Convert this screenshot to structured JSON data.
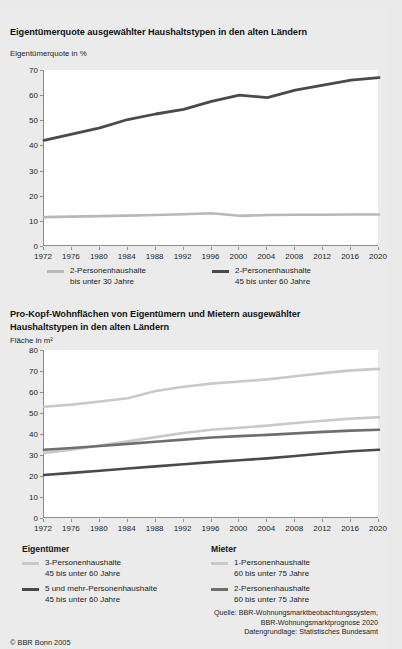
{
  "meta": {
    "copyright": "© BBR Bonn 2005",
    "source_lines": [
      "Quelle: BBR-Wohnungsmarktbeobachtungssystem,",
      "BBR-Wohnungsmarktprognose 2020",
      "Datengrundlage: Statistisches Bundesamt"
    ]
  },
  "colors": {
    "light": "#b8b8b8",
    "midlight": "#c9c9c9",
    "mid": "#6e6e6e",
    "dark": "#4a4a4a",
    "axis": "#8d8d8d",
    "background": "#ebebeb",
    "plot_background": "#ffffff"
  },
  "chart_data": [
    {
      "id": "eigentumerquote",
      "type": "line",
      "title": "Eigentümerquote ausgewählter Haushaltstypen in den alten Ländern",
      "ylabel": "Eigentümerquote in %",
      "xlabel": "",
      "ylim": [
        0,
        70
      ],
      "yticks": [
        0,
        10,
        20,
        30,
        40,
        50,
        60,
        70
      ],
      "x": [
        1972,
        1976,
        1980,
        1984,
        1988,
        1992,
        1996,
        2000,
        2004,
        2008,
        2012,
        2016,
        2020
      ],
      "xticks": [
        1972,
        1976,
        1980,
        1984,
        1988,
        1992,
        1996,
        2000,
        2004,
        2008,
        2012,
        2016,
        2020
      ],
      "grid": false,
      "legend_position": "bottom",
      "series": [
        {
          "name": "2-Personenhaushalte bis unter 30 Jahre",
          "label_line1": "2-Personenhaushalte",
          "label_line2": "bis unter 30 Jahre",
          "color": "#b8b8b8",
          "width": 2.6,
          "values": [
            11.5,
            11.7,
            11.9,
            12.1,
            12.3,
            12.6,
            13.0,
            12.0,
            12.3,
            12.4,
            12.4,
            12.5,
            12.5
          ]
        },
        {
          "name": "2-Personenhaushalte 45 bis unter 60 Jahre",
          "label_line1": "2-Personenhaushalte",
          "label_line2": "45 bis unter 60 Jahre",
          "color": "#4a4a4a",
          "width": 2.8,
          "values": [
            42.0,
            44.5,
            47.0,
            50.3,
            52.5,
            54.3,
            57.5,
            60.0,
            59.0,
            62.0,
            64.0,
            66.0,
            67.0
          ]
        }
      ]
    },
    {
      "id": "pro-kopf-wohnflaechen",
      "type": "line",
      "title": "Pro-Kopf-Wohnflächen von Eigentümern und Mietern ausgewählter Haushaltstypen in den alten Ländern",
      "title_line1": "Pro-Kopf-Wohnflächen von Eigentümern und Mietern ausgewählter",
      "title_line2": "Haushaltstypen in den alten Ländern",
      "ylabel": "Fläche in m²",
      "xlabel": "",
      "ylim": [
        0,
        80
      ],
      "yticks": [
        0,
        10,
        20,
        30,
        40,
        50,
        60,
        70,
        80
      ],
      "x": [
        1972,
        1976,
        1980,
        1984,
        1988,
        1992,
        1996,
        2000,
        2004,
        2008,
        2012,
        2016,
        2020
      ],
      "xticks": [
        1972,
        1976,
        1980,
        1984,
        1988,
        1992,
        1996,
        2000,
        2004,
        2008,
        2012,
        2016,
        2020
      ],
      "grid": false,
      "legend_position": "bottom",
      "legend_groups": [
        {
          "heading": "Eigentümer",
          "entries": [
            {
              "label_line1": "3-Personenhaushalte",
              "label_line2": "45 bis unter 60 Jahre",
              "color": "#c9c9c9"
            },
            {
              "label_line1": "5 und mehr-Personenhaushalte",
              "label_line2": "45 bis unter 60 Jahre",
              "color": "#4a4a4a"
            }
          ]
        },
        {
          "heading": "Mieter",
          "entries": [
            {
              "label_line1": "1-Personenhaushalte",
              "label_line2": "60 bis unter 75 Jahre",
              "color": "#c9c9c9"
            },
            {
              "label_line1": "2-Personenhaushalte",
              "label_line2": "60 bis unter 75 Jahre",
              "color": "#6e6e6e"
            }
          ]
        }
      ],
      "series": [
        {
          "name": "Mieter 1-Personenhaushalte 60 bis unter 75 Jahre",
          "color": "#c9c9c9",
          "width": 2.6,
          "values": [
            53.0,
            54.0,
            55.5,
            57.0,
            60.5,
            62.5,
            64.0,
            65.0,
            66.0,
            67.5,
            69.0,
            70.3,
            71.0
          ]
        },
        {
          "name": "Eigentümer 3-Personenhaushalte 45 bis unter 60 Jahre",
          "color": "#c9c9c9",
          "width": 2.6,
          "values": [
            31.0,
            32.5,
            34.5,
            36.5,
            38.5,
            40.5,
            42.0,
            43.0,
            44.0,
            45.2,
            46.3,
            47.3,
            48.0
          ]
        },
        {
          "name": "Mieter 2-Personenhaushalte 60 bis unter 75 Jahre",
          "color": "#6e6e6e",
          "width": 2.6,
          "values": [
            32.5,
            33.3,
            34.3,
            35.3,
            36.3,
            37.3,
            38.3,
            39.0,
            39.6,
            40.3,
            41.0,
            41.6,
            42.0
          ]
        },
        {
          "name": "Eigentümer 5 und mehr-Personenhaushalte 45 bis unter 60 Jahre",
          "color": "#4a4a4a",
          "width": 2.6,
          "values": [
            20.5,
            21.5,
            22.5,
            23.6,
            24.6,
            25.6,
            26.6,
            27.5,
            28.4,
            29.5,
            30.7,
            31.8,
            32.5
          ]
        }
      ]
    }
  ]
}
